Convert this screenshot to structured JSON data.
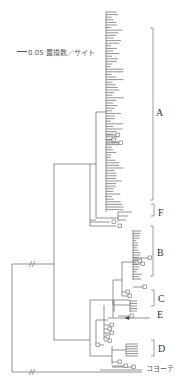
{
  "diagram": {
    "type": "phylogenetic-tree",
    "scale": {
      "value": "0.05",
      "unit": "置換数／サイト",
      "label": "0.05 置換数／サイト"
    },
    "clades": [
      {
        "id": "A",
        "label": "A"
      },
      {
        "id": "F",
        "label": "F"
      },
      {
        "id": "B",
        "label": "B"
      },
      {
        "id": "C",
        "label": "C"
      },
      {
        "id": "E",
        "label": "E"
      },
      {
        "id": "D",
        "label": "D"
      }
    ],
    "outgroup": {
      "label": "コヨーテ"
    },
    "colors": {
      "line": "#555555",
      "text": "#333333",
      "background": "#ffffff"
    }
  }
}
